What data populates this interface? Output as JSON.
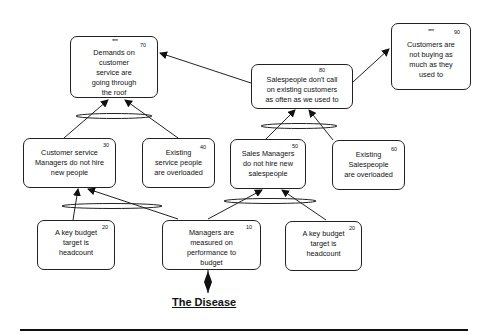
{
  "diagram": {
    "type": "current-reality-tree",
    "nodes": [
      {
        "id": "n70",
        "number": "70",
        "marker": "***",
        "text": "Demands on customer service are going through the roof"
      },
      {
        "id": "n80",
        "number": "80",
        "marker": "",
        "text": "Salespeople  don't call on existing customers as often as we used to"
      },
      {
        "id": "n90",
        "number": "90",
        "marker": "***",
        "text": "Customers are not buying as much as they used to"
      },
      {
        "id": "n30",
        "number": "30",
        "marker": "",
        "text": "Customer service Managers do not hire new people"
      },
      {
        "id": "n40",
        "number": "40",
        "marker": "",
        "text": "Existing service people are overloaded"
      },
      {
        "id": "n50",
        "number": "50",
        "marker": "",
        "text": "Sales Managers do not hire new salespeople"
      },
      {
        "id": "n60",
        "number": "60",
        "marker": "",
        "text": "Existing Salespeople are overloaded"
      },
      {
        "id": "n20a",
        "number": "20",
        "marker": "",
        "text": "A key budget target is headcount"
      },
      {
        "id": "n10",
        "number": "10",
        "marker": "",
        "text": "Managers are measured on performance to budget"
      },
      {
        "id": "n20b",
        "number": "20",
        "marker": "",
        "text": "A key budget target is headcount"
      }
    ],
    "edges": [
      {
        "from": "n30",
        "to": "n70",
        "and_group": "A"
      },
      {
        "from": "n40",
        "to": "n70",
        "and_group": "A"
      },
      {
        "from": "n50",
        "to": "n80",
        "and_group": "B"
      },
      {
        "from": "n60",
        "to": "n80",
        "and_group": "B"
      },
      {
        "from": "n80",
        "to": "n70"
      },
      {
        "from": "n80",
        "to": "n90"
      },
      {
        "from": "n20a",
        "to": "n30",
        "and_group": "C"
      },
      {
        "from": "n10",
        "to": "n30",
        "and_group": "C"
      },
      {
        "from": "n10",
        "to": "n50",
        "and_group": "D"
      },
      {
        "from": "n20b",
        "to": "n50",
        "and_group": "D"
      }
    ],
    "root_label": "The Disease"
  },
  "labels": {
    "n70_lines": [
      "Demands on",
      "customer",
      "service are",
      "going through",
      "the roof"
    ],
    "n80_lines": [
      "Salespeople  don't call",
      "on existing customers",
      "as often as we used to"
    ],
    "n90_lines": [
      "Customers are",
      "not buying as",
      "much as they",
      "used to"
    ],
    "n30_lines": [
      "Customer service",
      "Managers do not hire",
      "new people"
    ],
    "n40_lines": [
      "Existing",
      "service people",
      "are overloaded"
    ],
    "n50_lines": [
      "Sales Managers",
      "do not hire new",
      "salespeople"
    ],
    "n60_lines": [
      "Existing",
      "Salespeople",
      "are overloaded"
    ],
    "n20a_lines": [
      "A key budget",
      "target is",
      "headcount"
    ],
    "n10_lines": [
      "Managers are",
      "measured on",
      "performance to",
      "budget"
    ],
    "n20b_lines": [
      "A key budget",
      "target is",
      "headcount"
    ]
  },
  "colors": {
    "line": "#222222",
    "background": "#ffffff",
    "text": "#111111"
  }
}
